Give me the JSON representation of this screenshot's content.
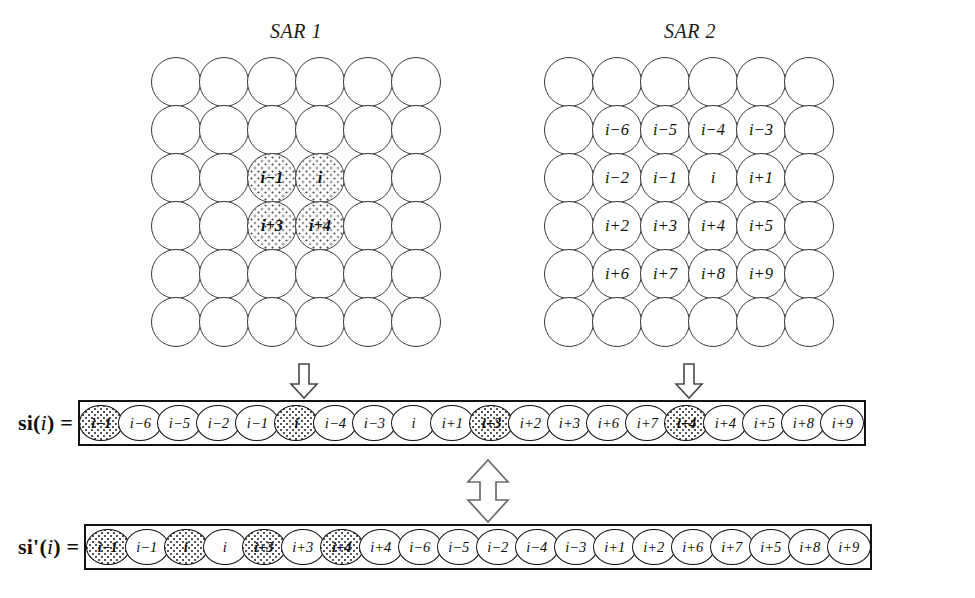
{
  "figure": {
    "sar1": {
      "title": "SAR 1",
      "rows": 6,
      "cols": 6,
      "cells": [
        {
          "label": "",
          "shaded": false
        },
        {
          "label": "",
          "shaded": false
        },
        {
          "label": "",
          "shaded": false
        },
        {
          "label": "",
          "shaded": false
        },
        {
          "label": "",
          "shaded": false
        },
        {
          "label": "",
          "shaded": false
        },
        {
          "label": "",
          "shaded": false
        },
        {
          "label": "",
          "shaded": false
        },
        {
          "label": "",
          "shaded": false
        },
        {
          "label": "",
          "shaded": false
        },
        {
          "label": "",
          "shaded": false
        },
        {
          "label": "",
          "shaded": false
        },
        {
          "label": "",
          "shaded": false
        },
        {
          "label": "",
          "shaded": false
        },
        {
          "label": "i−1",
          "shaded": true
        },
        {
          "label": "i",
          "shaded": true
        },
        {
          "label": "",
          "shaded": false
        },
        {
          "label": "",
          "shaded": false
        },
        {
          "label": "",
          "shaded": false
        },
        {
          "label": "",
          "shaded": false
        },
        {
          "label": "i+3",
          "shaded": true
        },
        {
          "label": "i+4",
          "shaded": true
        },
        {
          "label": "",
          "shaded": false
        },
        {
          "label": "",
          "shaded": false
        },
        {
          "label": "",
          "shaded": false
        },
        {
          "label": "",
          "shaded": false
        },
        {
          "label": "",
          "shaded": false
        },
        {
          "label": "",
          "shaded": false
        },
        {
          "label": "",
          "shaded": false
        },
        {
          "label": "",
          "shaded": false
        },
        {
          "label": "",
          "shaded": false
        },
        {
          "label": "",
          "shaded": false
        },
        {
          "label": "",
          "shaded": false
        },
        {
          "label": "",
          "shaded": false
        },
        {
          "label": "",
          "shaded": false
        },
        {
          "label": "",
          "shaded": false
        }
      ]
    },
    "sar2": {
      "title": "SAR 2",
      "rows": 6,
      "cols": 6,
      "cells": [
        {
          "label": "",
          "shaded": false
        },
        {
          "label": "",
          "shaded": false
        },
        {
          "label": "",
          "shaded": false
        },
        {
          "label": "",
          "shaded": false
        },
        {
          "label": "",
          "shaded": false
        },
        {
          "label": "",
          "shaded": false
        },
        {
          "label": "",
          "shaded": false
        },
        {
          "label": "i−6",
          "shaded": false
        },
        {
          "label": "i−5",
          "shaded": false
        },
        {
          "label": "i−4",
          "shaded": false
        },
        {
          "label": "i−3",
          "shaded": false
        },
        {
          "label": "",
          "shaded": false
        },
        {
          "label": "",
          "shaded": false
        },
        {
          "label": "i−2",
          "shaded": false
        },
        {
          "label": "i−1",
          "shaded": false
        },
        {
          "label": "i",
          "shaded": false
        },
        {
          "label": "i+1",
          "shaded": false
        },
        {
          "label": "",
          "shaded": false
        },
        {
          "label": "",
          "shaded": false
        },
        {
          "label": "i+2",
          "shaded": false
        },
        {
          "label": "i+3",
          "shaded": false
        },
        {
          "label": "i+4",
          "shaded": false
        },
        {
          "label": "i+5",
          "shaded": false
        },
        {
          "label": "",
          "shaded": false
        },
        {
          "label": "",
          "shaded": false
        },
        {
          "label": "i+6",
          "shaded": false
        },
        {
          "label": "i+7",
          "shaded": false
        },
        {
          "label": "i+8",
          "shaded": false
        },
        {
          "label": "i+9",
          "shaded": false
        },
        {
          "label": "",
          "shaded": false
        },
        {
          "label": "",
          "shaded": false
        },
        {
          "label": "",
          "shaded": false
        },
        {
          "label": "",
          "shaded": false
        },
        {
          "label": "",
          "shaded": false
        },
        {
          "label": "",
          "shaded": false
        },
        {
          "label": "",
          "shaded": false
        }
      ]
    },
    "arrows": {
      "sar1_down": "down-arrow",
      "sar2_down": "down-arrow",
      "swap": "up-down-double-arrow"
    },
    "sequences": [
      {
        "id": "si",
        "label_plain": "si(i) =",
        "label_parts": {
          "name": "si",
          "open": "(",
          "arg": "i",
          "close": ")",
          "equals": "="
        },
        "cells": [
          {
            "label": "i−1",
            "shaded": true
          },
          {
            "label": "i−6",
            "shaded": false
          },
          {
            "label": "i−5",
            "shaded": false
          },
          {
            "label": "i−2",
            "shaded": false
          },
          {
            "label": "i−1",
            "shaded": false
          },
          {
            "label": "i",
            "shaded": true
          },
          {
            "label": "i−4",
            "shaded": false
          },
          {
            "label": "i−3",
            "shaded": false
          },
          {
            "label": "i",
            "shaded": false
          },
          {
            "label": "i+1",
            "shaded": false
          },
          {
            "label": "i+3",
            "shaded": true
          },
          {
            "label": "i+2",
            "shaded": false
          },
          {
            "label": "i+3",
            "shaded": false
          },
          {
            "label": "i+6",
            "shaded": false
          },
          {
            "label": "i+7",
            "shaded": false
          },
          {
            "label": "i+4",
            "shaded": true
          },
          {
            "label": "i+4",
            "shaded": false
          },
          {
            "label": "i+5",
            "shaded": false
          },
          {
            "label": "i+8",
            "shaded": false
          },
          {
            "label": "i+9",
            "shaded": false
          }
        ]
      },
      {
        "id": "si-prime",
        "label_plain": "si'(i) =",
        "label_parts": {
          "name": "si",
          "prime": "'",
          "open": "(",
          "arg": "i",
          "close": ")",
          "equals": "="
        },
        "cells": [
          {
            "label": "i−1",
            "shaded": true
          },
          {
            "label": "i−1",
            "shaded": false
          },
          {
            "label": "i",
            "shaded": true
          },
          {
            "label": "i",
            "shaded": false
          },
          {
            "label": "i+3",
            "shaded": true
          },
          {
            "label": "i+3",
            "shaded": false
          },
          {
            "label": "i+4",
            "shaded": true
          },
          {
            "label": "i+4",
            "shaded": false
          },
          {
            "label": "i−6",
            "shaded": false
          },
          {
            "label": "i−5",
            "shaded": false
          },
          {
            "label": "i−2",
            "shaded": false
          },
          {
            "label": "i−4",
            "shaded": false
          },
          {
            "label": "i−3",
            "shaded": false
          },
          {
            "label": "i+1",
            "shaded": false
          },
          {
            "label": "i+2",
            "shaded": false
          },
          {
            "label": "i+6",
            "shaded": false
          },
          {
            "label": "i+7",
            "shaded": false
          },
          {
            "label": "i+5",
            "shaded": false
          },
          {
            "label": "i+8",
            "shaded": false
          },
          {
            "label": "i+9",
            "shaded": false
          }
        ]
      }
    ],
    "colors": {
      "background": "#ffffff",
      "stroke": "#111111",
      "grid_stroke": "#3a3a3a",
      "shade_dots": "#4a4a4a"
    }
  }
}
